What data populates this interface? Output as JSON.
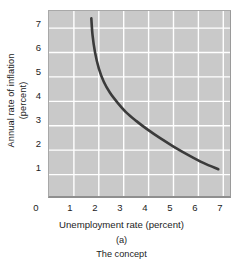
{
  "chart_data": {
    "type": "line",
    "title": "",
    "subtitle": "",
    "xlabel": "Unemployment rate (percent)",
    "ylabel_line1": "Annual rate of inflation",
    "ylabel_line2": "(percent)",
    "panel_label": "(a)",
    "panel_caption": "The concept",
    "xlim": [
      0,
      7.35
    ],
    "ylim": [
      0,
      7.7
    ],
    "grid": true,
    "legend": "none",
    "xticks": [
      "0",
      "1",
      "2",
      "3",
      "4",
      "5",
      "6",
      "7"
    ],
    "xtick_values": [
      0,
      1,
      2,
      3,
      4,
      5,
      6,
      7
    ],
    "yticks": [
      "1",
      "2",
      "3",
      "4",
      "5",
      "6",
      "7"
    ],
    "ytick_values": [
      1,
      2,
      3,
      4,
      5,
      6,
      7
    ],
    "y_origin_label": "0",
    "series": [
      {
        "name": "Phillips curve",
        "color": "#3b3b3b",
        "x": [
          1.7,
          1.75,
          1.85,
          2.0,
          2.2,
          2.45,
          2.75,
          3.1,
          3.5,
          3.95,
          4.45,
          5.0,
          5.6,
          6.2,
          6.8
        ],
        "y": [
          7.4,
          6.7,
          6.0,
          5.35,
          4.8,
          4.35,
          3.95,
          3.55,
          3.2,
          2.85,
          2.5,
          2.15,
          1.8,
          1.48,
          1.22
        ]
      }
    ]
  },
  "colors": {
    "plot_background": "#c9c9c9",
    "gridline": "#ffffff",
    "curve": "#3b3b3b",
    "text": "#1c1c1c",
    "page_background": "#ffffff"
  }
}
